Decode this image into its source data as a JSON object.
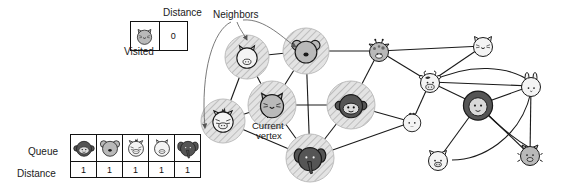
{
  "figure": {
    "type": "bfs-graph-traversal-illustration",
    "background": "#ffffff",
    "line_color": "#1a1a1a",
    "highlight_fill": "#d8d8d8",
    "annotations": {
      "neighbors_label": "Neighbors",
      "current_vertex_label_line1": "Current",
      "current_vertex_label_line2": "vertex"
    }
  },
  "visited_table": {
    "title": "Distance",
    "caption": "Visited",
    "rows": [
      {
        "animal": "cat-icon",
        "distance": "0"
      }
    ]
  },
  "queue_table": {
    "row_labels": {
      "queue": "Queue",
      "distance": "Distance"
    },
    "entries": [
      {
        "animal": "monkey-icon",
        "distance": "1"
      },
      {
        "animal": "koala-icon",
        "distance": "1"
      },
      {
        "animal": "zebra-icon",
        "distance": "1"
      },
      {
        "animal": "horse-icon",
        "distance": "1"
      },
      {
        "animal": "elephant-icon",
        "distance": "1"
      }
    ]
  },
  "graph": {
    "nodes": [
      {
        "id": "horse",
        "icon": "horse-icon",
        "x": 247,
        "y": 57,
        "r": 15,
        "shade": "light",
        "highlighted": true,
        "label": "Horse"
      },
      {
        "id": "koala",
        "icon": "koala-icon",
        "x": 306,
        "y": 51,
        "r": 16,
        "shade": "medium",
        "highlighted": true,
        "label": "Koala"
      },
      {
        "id": "giraffe",
        "icon": "giraffe-icon",
        "x": 379,
        "y": 51,
        "r": 14,
        "shade": "medium",
        "highlighted": false,
        "label": "Giraffe"
      },
      {
        "id": "cat-tr",
        "icon": "cat-icon",
        "x": 483,
        "y": 46,
        "r": 14,
        "shade": "light",
        "highlighted": false,
        "label": "Cat"
      },
      {
        "id": "cow",
        "icon": "cow-icon",
        "x": 430,
        "y": 82,
        "r": 14,
        "shade": "light",
        "highlighted": false,
        "label": "Cow"
      },
      {
        "id": "rabbit",
        "icon": "rabbit-icon",
        "x": 531,
        "y": 86,
        "r": 14,
        "shade": "light",
        "highlighted": false,
        "label": "Rabbit"
      },
      {
        "id": "lion",
        "icon": "lion-icon",
        "x": 478,
        "y": 105,
        "r": 17,
        "shade": "dark",
        "highlighted": false,
        "label": "Lion"
      },
      {
        "id": "zebra",
        "icon": "zebra-icon",
        "x": 223,
        "y": 121,
        "r": 15,
        "shade": "light",
        "highlighted": true,
        "label": "Zebra"
      },
      {
        "id": "cat-cur",
        "icon": "cat-icon",
        "x": 272,
        "y": 105,
        "r": 17,
        "shade": "medium",
        "highlighted": true,
        "label": "Cat (current)"
      },
      {
        "id": "monkey",
        "icon": "monkey-icon",
        "x": 351,
        "y": 105,
        "r": 17,
        "shade": "dark",
        "highlighted": true,
        "label": "Monkey"
      },
      {
        "id": "chick",
        "icon": "chick-icon",
        "x": 412,
        "y": 122,
        "r": 13,
        "shade": "light",
        "highlighted": false,
        "label": "Chick"
      },
      {
        "id": "elephant",
        "icon": "elephant-icon",
        "x": 310,
        "y": 158,
        "r": 17,
        "shade": "dark",
        "highlighted": true,
        "label": "Elephant"
      },
      {
        "id": "pig",
        "icon": "pig-icon",
        "x": 438,
        "y": 160,
        "r": 14,
        "shade": "light",
        "highlighted": false,
        "label": "Pig"
      },
      {
        "id": "boar",
        "icon": "boar-icon",
        "x": 530,
        "y": 155,
        "r": 14,
        "shade": "medium",
        "highlighted": false,
        "label": "Boar"
      }
    ],
    "edges": [
      [
        "horse",
        "zebra"
      ],
      [
        "horse",
        "cat-cur"
      ],
      [
        "horse",
        "koala"
      ],
      [
        "koala",
        "giraffe"
      ],
      [
        "koala",
        "cat-cur"
      ],
      [
        "koala",
        "elephant"
      ],
      [
        "giraffe",
        "cat-tr"
      ],
      [
        "giraffe",
        "cow"
      ],
      [
        "giraffe",
        "monkey"
      ],
      [
        "cat-tr",
        "cow"
      ],
      [
        "cow",
        "chick"
      ],
      [
        "cow",
        "lion"
      ],
      [
        "cow",
        "rabbit"
      ],
      [
        "lion",
        "rabbit"
      ],
      [
        "lion",
        "pig"
      ],
      [
        "lion",
        "boar"
      ],
      [
        "rabbit",
        "boar"
      ],
      [
        "cat-cur",
        "zebra"
      ],
      [
        "cat-cur",
        "monkey"
      ],
      [
        "cat-cur",
        "elephant"
      ],
      [
        "monkey",
        "elephant"
      ],
      [
        "monkey",
        "chick"
      ],
      [
        "zebra",
        "elephant"
      ],
      [
        "elephant",
        "chick"
      ]
    ]
  }
}
